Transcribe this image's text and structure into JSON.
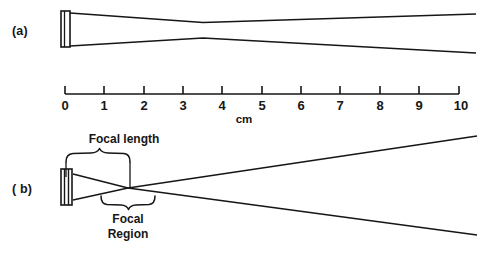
{
  "figure": {
    "background_color": "#ffffff",
    "ink_color": "#161616",
    "width": 483,
    "height": 264
  },
  "panels": [
    {
      "id": "a",
      "label": "(a)",
      "label_x": 12,
      "label_y": 24,
      "type": "unfocused-transducer-beam",
      "transducer": {
        "kind": "flat-element",
        "x": 61,
        "y_top": 11,
        "y_bottom": 47,
        "width": 9,
        "line_count": 2
      },
      "beam": {
        "upper_profile": [
          {
            "x": 71,
            "y": 13
          },
          {
            "x": 203,
            "y": 22
          },
          {
            "x": 475,
            "y": 14
          }
        ],
        "lower_profile": [
          {
            "x": 71,
            "y": 46
          },
          {
            "x": 203,
            "y": 38
          },
          {
            "x": 475,
            "y": 53
          }
        ],
        "waist_x": 203,
        "waist_cm": 3
      }
    },
    {
      "id": "b",
      "label": "( b)",
      "label_x": 12,
      "label_y": 188,
      "type": "focused-transducer-beam",
      "transducer": {
        "kind": "curved-focused-element",
        "x": 61,
        "y_top": 169,
        "y_bottom": 205,
        "width": 11,
        "line_count": 4
      },
      "beam": {
        "upper_profile": [
          {
            "x": 73,
            "y": 174
          },
          {
            "x": 128,
            "y": 188
          },
          {
            "x": 477,
            "y": 235
          }
        ],
        "lower_profile": [
          {
            "x": 73,
            "y": 200
          },
          {
            "x": 128,
            "y": 188
          },
          {
            "x": 477,
            "y": 136
          }
        ],
        "focus_x": 128,
        "focus_y": 188
      },
      "annotations": [
        {
          "name": "focal-length",
          "text": "Focal length",
          "text_x": 124,
          "text_y": 135,
          "brace_left_x": 66,
          "brace_right_x": 129,
          "brace_y": 161,
          "brace_direction": "down",
          "leader_left": {
            "x": 66,
            "y_from": 161,
            "y_to": 177
          },
          "leader_right": {
            "x": 129,
            "y_from": 161,
            "y_to": 188
          }
        },
        {
          "name": "focal-region",
          "text_line_1": "Focal",
          "text_line_2": "Region",
          "text_x": 128,
          "text_y": 218,
          "brace_left_x": 101,
          "brace_right_x": 155,
          "brace_y": 202,
          "brace_direction": "up"
        }
      ]
    }
  ],
  "scale_bar": {
    "name": "centimeter-ruler",
    "axis_y": 94,
    "x_start": 65,
    "x_end": 459,
    "tick_height": 8,
    "unit_label": "cm",
    "unit_label_x": 244,
    "unit_label_y": 114,
    "ticks": [
      {
        "value": 0,
        "label": "0",
        "x": 65
      },
      {
        "value": 1,
        "label": "1",
        "x": 104
      },
      {
        "value": 2,
        "label": "2",
        "x": 144
      },
      {
        "value": 3,
        "label": "3",
        "x": 183
      },
      {
        "value": 4,
        "label": "4",
        "x": 222
      },
      {
        "value": 5,
        "label": "5",
        "x": 262
      },
      {
        "value": 6,
        "label": "6",
        "x": 301
      },
      {
        "value": 7,
        "label": "7",
        "x": 340
      },
      {
        "value": 8,
        "label": "8",
        "x": 380
      },
      {
        "value": 9,
        "label": "9",
        "x": 419
      },
      {
        "value": 10,
        "label": "10",
        "x": 459
      }
    ],
    "tick_label_y": 98
  }
}
